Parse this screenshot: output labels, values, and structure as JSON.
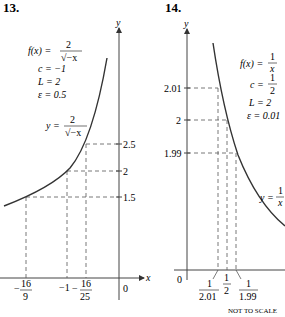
{
  "graph13": {
    "number": "13.",
    "axis_x": "x",
    "axis_y": "y",
    "f_label": "f(x) =",
    "f_num": "2",
    "f_den": "√−x",
    "c": "c = −1",
    "L": "L = 2",
    "eps": "ε = 0.5",
    "curve_label": "y =",
    "curve_num": "2",
    "curve_den": "√−x",
    "y_ticks": [
      "2.5",
      "2",
      "1.5"
    ],
    "x_ticks": [
      {
        "sign": "−",
        "num": "16",
        "den": "9"
      },
      {
        "text": "−1"
      },
      {
        "sign": "−",
        "num": "16",
        "den": "25"
      }
    ],
    "origin": "0"
  },
  "graph14": {
    "number": "14.",
    "axis_x": "x",
    "axis_y": "y",
    "f_label": "f(x) =",
    "f_num": "1",
    "f_den": "x",
    "c_label": "c =",
    "c_num": "1",
    "c_den": "2",
    "L": "L = 2",
    "eps": "ε = 0.01",
    "curve_label": "y =",
    "curve_num": "1",
    "curve_den": "x",
    "y_ticks": [
      "2.01",
      "2",
      "1.99"
    ],
    "x_ticks": [
      {
        "num": "1",
        "den": "2.01"
      },
      {
        "num": "1",
        "den": "2"
      },
      {
        "num": "1",
        "den": "1.99"
      }
    ],
    "origin": "0",
    "note": "NOT TO SCALE"
  }
}
